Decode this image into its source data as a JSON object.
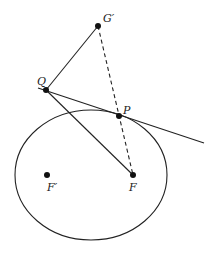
{
  "diagram": {
    "colors": {
      "stroke": "#222222",
      "background": "#ffffff"
    },
    "ellipse": {
      "cx": 91,
      "cy": 175,
      "rx": 76,
      "ry": 65
    },
    "points": {
      "G_prime": {
        "label": "G′",
        "x": 98,
        "y": 26
      },
      "Q": {
        "label": "Q",
        "x": 46,
        "y": 90
      },
      "P": {
        "label": "P",
        "x": 119,
        "y": 116
      },
      "F": {
        "label": "F",
        "x": 133,
        "y": 175
      },
      "F_prime": {
        "label": "F′",
        "x": 47,
        "y": 175
      }
    },
    "lines": [
      {
        "name": "QG'",
        "from": "Q",
        "to": "G_prime",
        "style": "solid"
      },
      {
        "name": "QF",
        "from": "Q",
        "to": "F",
        "style": "solid"
      },
      {
        "name": "tangent",
        "style": "solid",
        "x1": 38,
        "y1": 88,
        "x2": 204,
        "y2": 143
      },
      {
        "name": "G'F",
        "from": "G_prime",
        "to": "F",
        "style": "dashed"
      }
    ]
  }
}
